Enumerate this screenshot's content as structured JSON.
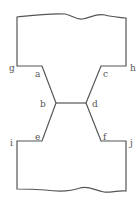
{
  "diagram": {
    "labels": {
      "a": "a",
      "b": "b",
      "c": "c",
      "d": "d",
      "e": "e",
      "f": "f",
      "g": "g",
      "h": "h",
      "i": "i",
      "j": "j"
    },
    "stroke_color": "#555555"
  }
}
